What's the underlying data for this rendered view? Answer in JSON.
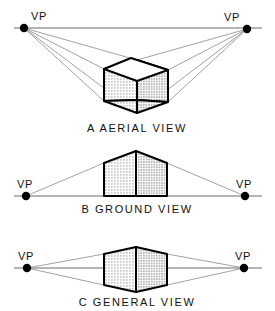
{
  "figure": {
    "title_present": false,
    "background_color": "#ffffff",
    "line_color": "#000000",
    "ray_color": "#8a8a8a",
    "horizon_color": "#6b6b6b",
    "vp_dot_color": "#000000"
  },
  "panels": [
    {
      "id": "aerial",
      "caption": "A  AERIAL VIEW",
      "caption_letter": "A",
      "caption_text": "AERIAL VIEW",
      "left_vp": {
        "label": "VP",
        "x": 24,
        "y": 28
      },
      "right_vp": {
        "label": "VP",
        "x": 247,
        "y": 29
      },
      "horizon": {
        "y": 28,
        "x1": 14,
        "x2": 262
      },
      "horizon_position": "above object",
      "object": {
        "type": "cube",
        "visible_faces": [
          "top",
          "left",
          "right"
        ],
        "top_face_shading": "white",
        "left_face_shading": "stipple-light",
        "right_face_shading": "stipple-dark"
      },
      "ray_count": 6
    },
    {
      "id": "ground",
      "caption": "B  GROUND VIEW",
      "caption_letter": "B",
      "caption_text": "GROUND VIEW",
      "left_vp": {
        "label": "VP",
        "x": 26,
        "y": 196
      },
      "right_vp": {
        "label": "VP",
        "x": 245,
        "y": 196
      },
      "horizon": {
        "y": 196,
        "x1": 14,
        "x2": 262
      },
      "horizon_position": "below object",
      "object": {
        "type": "box",
        "visible_faces": [
          "left",
          "right"
        ],
        "left_face_shading": "stipple-light",
        "right_face_shading": "stipple-dark"
      },
      "ray_count": 2
    },
    {
      "id": "general",
      "caption": "C  GENERAL VIEW",
      "caption_letter": "C",
      "caption_text": "GENERAL VIEW",
      "left_vp": {
        "label": "VP",
        "x": 27,
        "y": 268
      },
      "right_vp": {
        "label": "VP",
        "x": 244,
        "y": 268
      },
      "horizon": {
        "y": 268,
        "x1": 14,
        "x2": 262
      },
      "horizon_position": "through object",
      "object": {
        "type": "box",
        "visible_faces": [
          "left",
          "right"
        ],
        "left_face_shading": "stipple-light",
        "right_face_shading": "stipple-dark"
      },
      "ray_count": 4
    }
  ]
}
